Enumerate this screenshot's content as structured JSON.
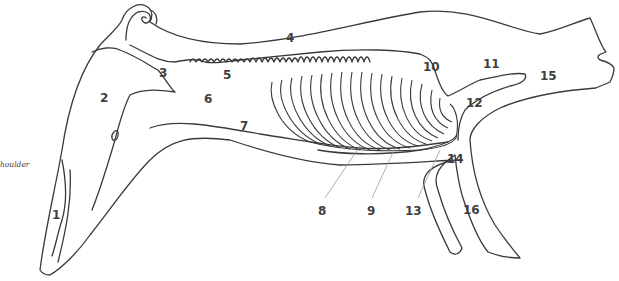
{
  "figure": {
    "caption_fragment": "houlder",
    "colors": {
      "line": "#3a3a3a",
      "label": "#3f3f3f",
      "leader": "#9a9a9a",
      "background": "#ffffff"
    }
  },
  "labels": [
    {
      "id": "1",
      "text": "1",
      "x": 52,
      "y": 209
    },
    {
      "id": "2",
      "text": "2",
      "x": 100,
      "y": 92
    },
    {
      "id": "3",
      "text": "3",
      "x": 159,
      "y": 67
    },
    {
      "id": "4",
      "text": "4",
      "x": 286,
      "y": 32
    },
    {
      "id": "5",
      "text": "5",
      "x": 223,
      "y": 69
    },
    {
      "id": "6",
      "text": "6",
      "x": 204,
      "y": 93
    },
    {
      "id": "7",
      "text": "7",
      "x": 240,
      "y": 120
    },
    {
      "id": "8",
      "text": "8",
      "x": 318,
      "y": 205
    },
    {
      "id": "9",
      "text": "9",
      "x": 367,
      "y": 205
    },
    {
      "id": "10",
      "text": "10",
      "x": 423,
      "y": 61
    },
    {
      "id": "11",
      "text": "11",
      "x": 483,
      "y": 58
    },
    {
      "id": "12",
      "text": "12",
      "x": 466,
      "y": 97
    },
    {
      "id": "13",
      "text": "13",
      "x": 405,
      "y": 205
    },
    {
      "id": "14",
      "text": "14",
      "x": 447,
      "y": 153
    },
    {
      "id": "15",
      "text": "15",
      "x": 540,
      "y": 70
    },
    {
      "id": "16",
      "text": "16",
      "x": 463,
      "y": 204
    }
  ]
}
